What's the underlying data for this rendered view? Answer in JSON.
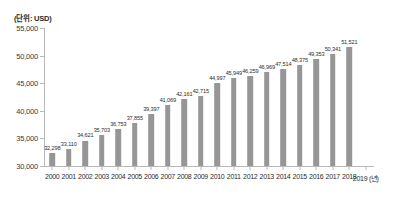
{
  "figure": {
    "unit_caption": "(단위: USD)",
    "bar_color": "#969696",
    "axis_color": "#b9b9b9",
    "label_color": "#2b2b2b"
  },
  "chart_data": {
    "type": "bar",
    "title": "",
    "subtitle": "",
    "xlabel": "(년)",
    "ylabel": "",
    "unit": "(단위: USD)",
    "grid": false,
    "legend": false,
    "legend_position": "none",
    "ylim": [
      30000,
      55000
    ],
    "ytick_labels": [
      "55,000",
      "50,000",
      "45,000",
      "40,000",
      "35,000",
      "30,000"
    ],
    "ytick_values": [
      55000,
      50000,
      45000,
      40000,
      35000,
      30000
    ],
    "categories": [
      "2000",
      "2001",
      "2002",
      "2003",
      "2004",
      "2005",
      "2006",
      "2007",
      "2008",
      "2009",
      "2010",
      "2011",
      "2012",
      "2013",
      "2014",
      "2015",
      "2016",
      "2017",
      "2018",
      "2019 (년)"
    ],
    "values": [
      32298,
      33110,
      34621,
      35703,
      36753,
      37855,
      39397,
      41069,
      42161,
      42715,
      44997,
      45949,
      46259,
      46969,
      47514,
      48375,
      49353,
      50341,
      51521,
      null
    ],
    "data_labels": [
      "32,298",
      "33,110",
      "34,621",
      "35,703",
      "36,753",
      "37,855",
      "39,397",
      "41,069",
      "42,161",
      "42,715",
      "44,997",
      "45,949",
      "46,259",
      "46,969",
      "47,514",
      "48,375",
      "49,353",
      "50,341",
      "51,521",
      ""
    ]
  }
}
